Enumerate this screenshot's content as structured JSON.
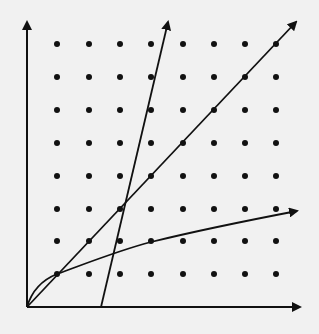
{
  "figure": {
    "background": "#f1f1f1",
    "ink": "#111111",
    "origin": [
      27,
      307
    ],
    "x_axis_end": [
      300,
      307
    ],
    "y_axis_end": [
      26,
      20
    ],
    "grid": {
      "columns_px": [
        57,
        89,
        120,
        151,
        183,
        214,
        245,
        276
      ],
      "rows_px": [
        44,
        77,
        110,
        143,
        176,
        209,
        241,
        274
      ],
      "dot_radius": 3
    },
    "curves": [
      {
        "name": "steep-line",
        "type": "line",
        "from": [
          101,
          307
        ],
        "to": [
          168,
          22
        ]
      },
      {
        "name": "diagonal-line",
        "type": "line",
        "from": [
          27,
          307
        ],
        "to": [
          296,
          22
        ]
      },
      {
        "name": "sqrt-curve",
        "type": "curve",
        "description": "concave increasing curve through (1,1), (4,2)"
      }
    ]
  }
}
